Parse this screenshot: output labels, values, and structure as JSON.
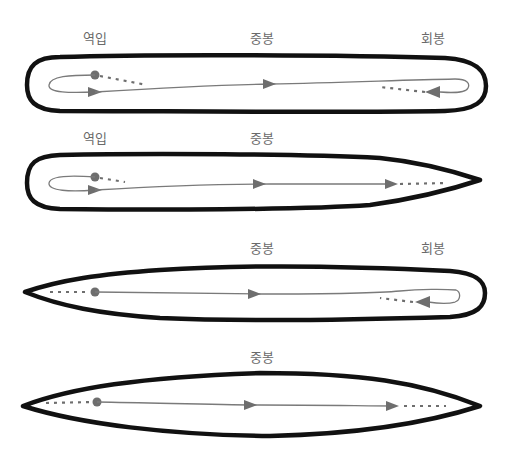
{
  "diagram": {
    "colors": {
      "outline": "#111111",
      "path": "#7a7a7a",
      "marker": "#6e6e6e",
      "label": "#6a6a6a",
      "background": "#ffffff"
    },
    "strokes": [
      {
        "id": "stroke-1",
        "shape": "rounded-both-ends",
        "labels": [
          {
            "text": "역입",
            "x": 95,
            "y": 28
          },
          {
            "text": "중봉",
            "x": 262,
            "y": 28
          },
          {
            "text": "회봉",
            "x": 433,
            "y": 28
          }
        ]
      },
      {
        "id": "stroke-2",
        "shape": "rounded-left-pointed-right",
        "labels": [
          {
            "text": "역입",
            "x": 95,
            "y": 128
          },
          {
            "text": "중봉",
            "x": 262,
            "y": 128
          }
        ]
      },
      {
        "id": "stroke-3",
        "shape": "pointed-left-rounded-right",
        "labels": [
          {
            "text": "중봉",
            "x": 262,
            "y": 238
          },
          {
            "text": "회봉",
            "x": 433,
            "y": 238
          }
        ]
      },
      {
        "id": "stroke-4",
        "shape": "pointed-both-ends",
        "labels": [
          {
            "text": "중봉",
            "x": 262,
            "y": 347
          }
        ]
      }
    ]
  }
}
